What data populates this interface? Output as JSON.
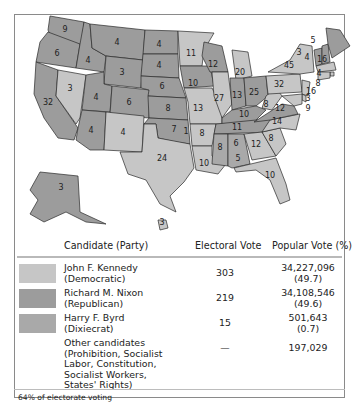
{
  "map": {
    "title": "1960 Presidential Election Electoral Map",
    "colors": {
      "democratic": "#c6c6c6",
      "republican": "#9c9c9c",
      "dixiecrat": "#a9a9a9",
      "border": "#2a2a2a"
    },
    "state_labels": [
      {
        "state": "WA",
        "value": "9"
      },
      {
        "state": "OR",
        "value": "6"
      },
      {
        "state": "CA",
        "value": "32"
      },
      {
        "state": "NV",
        "value": "3"
      },
      {
        "state": "ID",
        "value": "4"
      },
      {
        "state": "MT",
        "value": "4"
      },
      {
        "state": "WY",
        "value": "3"
      },
      {
        "state": "UT",
        "value": "4"
      },
      {
        "state": "CO",
        "value": "6"
      },
      {
        "state": "AZ",
        "value": "4"
      },
      {
        "state": "NM",
        "value": "4"
      },
      {
        "state": "ND",
        "value": "4"
      },
      {
        "state": "SD",
        "value": "4"
      },
      {
        "state": "NE",
        "value": "6"
      },
      {
        "state": "KS",
        "value": "8"
      },
      {
        "state": "OK",
        "value": "7"
      },
      {
        "state": "OK-Byrd",
        "value": "1"
      },
      {
        "state": "TX",
        "value": "24"
      },
      {
        "state": "MN",
        "value": "11"
      },
      {
        "state": "IA",
        "value": "10"
      },
      {
        "state": "MO",
        "value": "13"
      },
      {
        "state": "AR",
        "value": "8"
      },
      {
        "state": "LA",
        "value": "10"
      },
      {
        "state": "WI",
        "value": "12"
      },
      {
        "state": "IL",
        "value": "27"
      },
      {
        "state": "MI",
        "value": "20"
      },
      {
        "state": "IN",
        "value": "13"
      },
      {
        "state": "OH",
        "value": "25"
      },
      {
        "state": "KY",
        "value": "10"
      },
      {
        "state": "TN",
        "value": "11"
      },
      {
        "state": "MS",
        "value": "8"
      },
      {
        "state": "AL",
        "value": "6"
      },
      {
        "state": "AL-Byrd",
        "value": "5"
      },
      {
        "state": "GA",
        "value": "12"
      },
      {
        "state": "FL",
        "value": "10"
      },
      {
        "state": "SC",
        "value": "8"
      },
      {
        "state": "NC",
        "value": "14"
      },
      {
        "state": "VA",
        "value": "12"
      },
      {
        "state": "WV",
        "value": "8"
      },
      {
        "state": "PA",
        "value": "32"
      },
      {
        "state": "NY",
        "value": "45"
      },
      {
        "state": "VT",
        "value": "3"
      },
      {
        "state": "NH",
        "value": "4"
      },
      {
        "state": "ME",
        "value": "5"
      },
      {
        "state": "MA",
        "value": "16"
      },
      {
        "state": "RI",
        "value": "4"
      },
      {
        "state": "CT",
        "value": "8"
      },
      {
        "state": "NJ",
        "value": "16"
      },
      {
        "state": "DE",
        "value": "3"
      },
      {
        "state": "MD",
        "value": "9"
      },
      {
        "state": "AK",
        "value": "3"
      },
      {
        "state": "HI",
        "value": "3"
      }
    ]
  },
  "table": {
    "headers": {
      "candidate": "Candidate (Party)",
      "electoral": "Electoral Vote",
      "popular": "Popular Vote (%)"
    },
    "rows": [
      {
        "name": "John F. Kennedy\n(Democratic)",
        "electoral": "303",
        "popular": "34,227,096\n(49.7)",
        "swatch": "#c6c6c6"
      },
      {
        "name": "Richard M. Nixon\n(Republican)",
        "electoral": "219",
        "popular": "34,108,546\n(49.6)",
        "swatch": "#9c9c9c"
      },
      {
        "name": "Harry F. Byrd\n(Dixiecrat)",
        "electoral": "15",
        "popular": "501,643\n(0.7)",
        "swatch": "#a9a9a9"
      },
      {
        "name": "Other candidates\n(Prohibition, Socialist\nLabor, Constitution,\nSocialist Workers,\nStates' Rights)",
        "electoral": "—",
        "popular": "197,029",
        "swatch": ""
      }
    ],
    "footnote": "64% of electorate voting"
  }
}
